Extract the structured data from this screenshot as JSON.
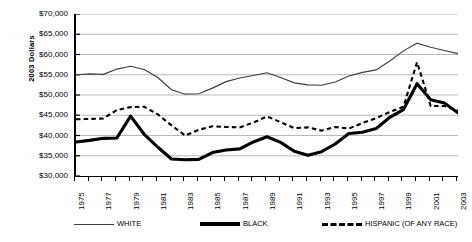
{
  "chart_data": {
    "type": "line",
    "title": "",
    "xlabel": "",
    "ylabel": "2003 Dollars",
    "ylim": [
      30000,
      70000
    ],
    "ytick_values": [
      70000,
      65000,
      60000,
      55000,
      50000,
      45000,
      40000,
      35000,
      30000
    ],
    "ytick_labels": [
      "$70,000",
      "$65,000",
      "$60,000",
      "$55,000",
      "$50,000",
      "$45,000",
      "$40,000",
      "$35,000",
      "$30,000"
    ],
    "xlim": [
      1975,
      2003
    ],
    "x": [
      1975,
      1976,
      1977,
      1978,
      1979,
      1980,
      1981,
      1982,
      1983,
      1984,
      1985,
      1986,
      1987,
      1988,
      1989,
      1990,
      1991,
      1992,
      1993,
      1994,
      1995,
      1996,
      1997,
      1998,
      1999,
      2000,
      2001,
      2002,
      2003
    ],
    "xtick_labels": [
      "1975",
      "1977",
      "1979",
      "1981",
      "1983",
      "1985",
      "1987",
      "1989",
      "1991",
      "1993",
      "1995",
      "1997",
      "1999",
      "2001",
      "2003"
    ],
    "xtick_values": [
      1975,
      1977,
      1979,
      1981,
      1983,
      1985,
      1987,
      1989,
      1991,
      1993,
      1995,
      1997,
      1999,
      2001,
      2003
    ],
    "grid": "horizontal",
    "legend_position": "bottom",
    "series": [
      {
        "name": "WHITE",
        "style": "thin-solid",
        "color": "#3d3d3d",
        "values": [
          55000,
          55200,
          55100,
          56400,
          57100,
          56300,
          54300,
          51300,
          50200,
          50300,
          51700,
          53300,
          54200,
          54800,
          55500,
          54300,
          53000,
          52500,
          52400,
          53200,
          54700,
          55600,
          56200,
          58400,
          60900,
          62800,
          61800,
          61000,
          60200
        ]
      },
      {
        "name": "BLACK",
        "style": "thick-solid",
        "color": "#000000",
        "values": [
          38400,
          38800,
          39300,
          39400,
          44800,
          40300,
          37100,
          34200,
          34000,
          34100,
          35800,
          36400,
          36700,
          38400,
          39700,
          38300,
          36100,
          35100,
          36000,
          37900,
          40500,
          40800,
          41700,
          44500,
          46400,
          52800,
          48800,
          48000,
          45600
        ]
      },
      {
        "name": "HISPANIC (OF ANY RACE)",
        "style": "dashed",
        "color": "#000000",
        "values": [
          44000,
          44100,
          44200,
          46300,
          47000,
          47100,
          45200,
          42500,
          40000,
          41400,
          42300,
          42100,
          42000,
          43200,
          44700,
          43300,
          41800,
          42000,
          41200,
          42100,
          41700,
          43100,
          44300,
          45800,
          47100,
          58100,
          47300,
          47300,
          46100
        ]
      }
    ]
  },
  "legend": {
    "items": [
      {
        "label": "WHITE",
        "swatch": "line-thin-swatch"
      },
      {
        "label": "BLACK",
        "swatch": "line-thick-swatch"
      },
      {
        "label": "HISPANIC (OF ANY RACE)",
        "swatch": "line-dashed-swatch"
      }
    ]
  }
}
